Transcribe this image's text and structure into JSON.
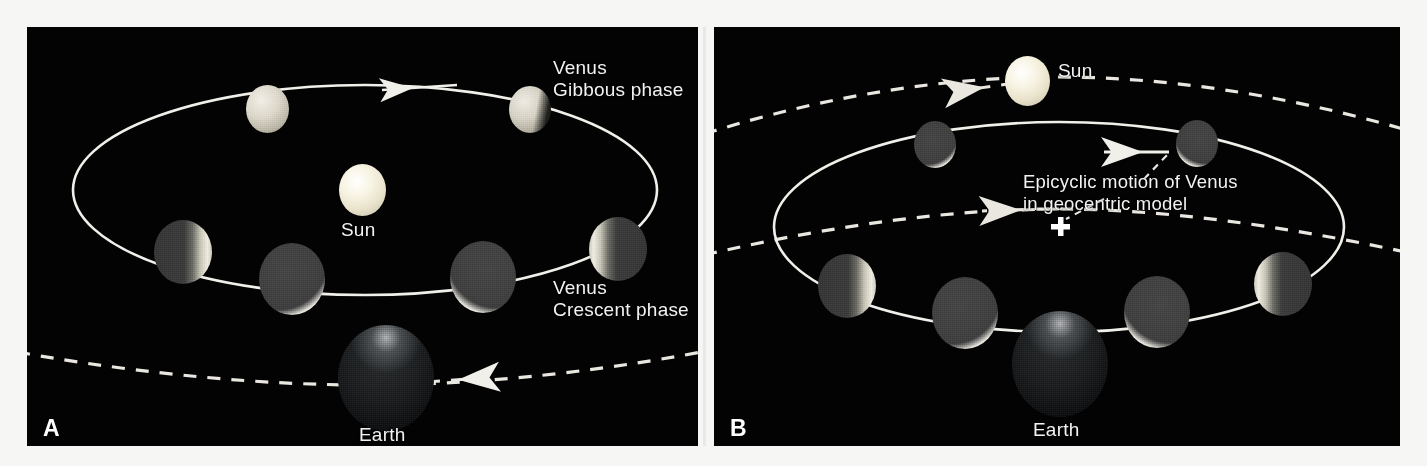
{
  "figure": {
    "background_color": "#ffffff",
    "panel_background": "#030303",
    "line_color": "#f0efe9",
    "sun_color": "#f2eddb",
    "venus_lit_color": "#ebe7dc",
    "venus_dark_color": "#434343",
    "text_color": "#f2f2f2"
  },
  "panels": [
    {
      "letter": "A",
      "name": "heliocentric-phases-of-venus",
      "labels": {
        "sun": "Sun",
        "earth": "Earth",
        "venus_gibbous": "Venus\nGibbous phase",
        "venus_crescent": "Venus\nCrescent phase"
      },
      "orbits": [
        {
          "name": "venus-orbit-around-sun",
          "style": "solid",
          "arrow": "left"
        },
        {
          "name": "earth-orbit-path",
          "style": "dashed",
          "arrow": "right"
        }
      ],
      "venus_positions": [
        {
          "name": "venus-upper-left",
          "phase": "full"
        },
        {
          "name": "venus-upper-right",
          "phase": "gibbous"
        },
        {
          "name": "venus-left",
          "phase": "crescent-right-lit"
        },
        {
          "name": "venus-lower-left",
          "phase": "new"
        },
        {
          "name": "venus-lower-right",
          "phase": "new"
        },
        {
          "name": "venus-right",
          "phase": "crescent-left-lit"
        }
      ]
    },
    {
      "letter": "B",
      "name": "geocentric-epicyclic-model",
      "labels": {
        "sun": "Sun",
        "earth": "Earth",
        "epicycle": "Epicyclic motion of Venus\nin geocentric model"
      },
      "orbits": [
        {
          "name": "venus-epicycle",
          "style": "solid",
          "arrow": "left"
        },
        {
          "name": "sun-deferent-upper",
          "style": "dashed",
          "arrow": "left"
        },
        {
          "name": "venus-deferent-lower",
          "style": "dashed",
          "arrow": "left"
        }
      ],
      "markers": [
        {
          "name": "epicycle-center-marker",
          "glyph": "plus"
        }
      ],
      "venus_positions": [
        {
          "name": "venus-upper-left",
          "phase": "new"
        },
        {
          "name": "venus-upper-right",
          "phase": "new"
        },
        {
          "name": "venus-left",
          "phase": "crescent-right-lit"
        },
        {
          "name": "venus-lower-left",
          "phase": "new"
        },
        {
          "name": "venus-lower-right",
          "phase": "new"
        },
        {
          "name": "venus-right",
          "phase": "crescent-left-lit"
        }
      ]
    }
  ]
}
